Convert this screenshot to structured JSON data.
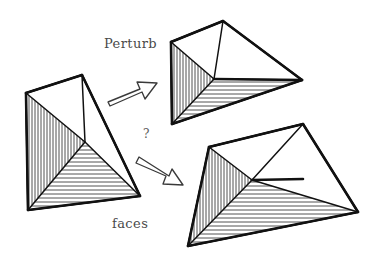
{
  "figure": {
    "background_color": "#ffffff",
    "ink_color": "#111111",
    "labels": {
      "perturb": "Perturb",
      "faces": "faces",
      "question": "?"
    },
    "label_positions": {
      "perturb": {
        "x": 104,
        "y": 48
      },
      "faces": {
        "x": 112,
        "y": 228
      },
      "question": {
        "x": 143,
        "y": 138
      }
    },
    "icons": {
      "arrow_up_right": "arrow-up-right-icon",
      "arrow_down_right": "arrow-down-right-icon"
    },
    "shapes": [
      {
        "id": "source-tetrahedron",
        "name": "source-tetrahedron",
        "role": "input",
        "position": "left",
        "vertices": {
          "apex": [
            82,
            75
          ],
          "left": [
            26,
            93
          ],
          "interior": [
            85,
            142
          ],
          "right": [
            140,
            196
          ],
          "bottom_left": [
            28,
            210
          ]
        },
        "faces": [
          {
            "name": "top-face",
            "fill": "none",
            "hatch": "none"
          },
          {
            "name": "left-face",
            "fill": "hatched",
            "hatch": "vertical"
          },
          {
            "name": "bottom-face",
            "fill": "hatched",
            "hatch": "horizontal"
          },
          {
            "name": "right-face",
            "fill": "none",
            "hatch": "none"
          }
        ]
      },
      {
        "id": "perturbed-tetrahedron-top",
        "name": "perturbed-tetrahedron-top",
        "role": "output-upper",
        "position": "top-right",
        "vertices": {
          "apex": [
            223,
            21
          ],
          "left": [
            171,
            42
          ],
          "interior": [
            214,
            79
          ],
          "right": [
            302,
            80
          ],
          "bottom_left": [
            172,
            124
          ]
        },
        "faces": [
          {
            "name": "top-face",
            "fill": "none",
            "hatch": "none"
          },
          {
            "name": "left-face",
            "fill": "hatched",
            "hatch": "vertical"
          },
          {
            "name": "bottom-face",
            "fill": "hatched",
            "hatch": "horizontal"
          },
          {
            "name": "right-face",
            "fill": "none",
            "hatch": "none"
          }
        ]
      },
      {
        "id": "perturbed-tetrahedron-bottom",
        "name": "perturbed-tetrahedron-bottom",
        "role": "output-lower",
        "position": "bottom-right",
        "vertices": {
          "apex": [
            303,
            124
          ],
          "left": [
            209,
            147
          ],
          "interior": [
            252,
            180
          ],
          "right": [
            358,
            212
          ],
          "bottom_left": [
            188,
            246
          ]
        },
        "faces": [
          {
            "name": "top-face",
            "fill": "none",
            "hatch": "none"
          },
          {
            "name": "left-face",
            "fill": "hatched",
            "hatch": "vertical"
          },
          {
            "name": "bottom-face",
            "fill": "hatched",
            "hatch": "horizontal"
          },
          {
            "name": "right-face",
            "fill": "none",
            "hatch": "none"
          }
        ]
      }
    ],
    "arrows": [
      {
        "id": "arrow-up-right",
        "name": "arrow-up-right-icon",
        "from": "source-tetrahedron",
        "to": "perturbed-tetrahedron-top",
        "direction": "up-right",
        "style": "hollow-outline"
      },
      {
        "id": "arrow-down-right",
        "name": "arrow-down-right-icon",
        "from": "source-tetrahedron",
        "to": "perturbed-tetrahedron-bottom",
        "direction": "down-right",
        "style": "hollow-outline"
      }
    ]
  }
}
